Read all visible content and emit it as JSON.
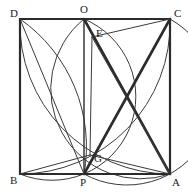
{
  "figure": {
    "background": "#ffffff",
    "stroke_color": "#3a3a3a",
    "thick_stroke_color": "#2b2b2b",
    "thin_width": 1,
    "medium_width": 1.4,
    "thick_width": 2.6,
    "viewbox": "0 0 188 192"
  },
  "points": [
    {
      "id": "D",
      "label": "D",
      "x": 20,
      "y": 19,
      "label_x": 10,
      "label_y": 17
    },
    {
      "id": "O",
      "label": "O",
      "x": 84,
      "y": 19,
      "label_x": 80,
      "label_y": 13
    },
    {
      "id": "C",
      "label": "C",
      "x": 170,
      "y": 19,
      "label_x": 174,
      "label_y": 17
    },
    {
      "id": "E",
      "label": "E",
      "x": 92,
      "y": 37,
      "label_x": 96,
      "label_y": 37
    },
    {
      "id": "G",
      "label": "G",
      "x": 90,
      "y": 155,
      "label_x": 94,
      "label_y": 162
    },
    {
      "id": "B",
      "label": "B",
      "x": 20,
      "y": 174,
      "label_x": 10,
      "label_y": 184
    },
    {
      "id": "P",
      "label": "P",
      "x": 84,
      "y": 174,
      "label_x": 80,
      "label_y": 186
    },
    {
      "id": "A",
      "label": "A",
      "x": 170,
      "y": 174,
      "label_x": 172,
      "label_y": 186
    }
  ],
  "square": {
    "name": "square-ABCD",
    "corners": "20,19 170,19 170,174 20,174"
  },
  "segments": [
    {
      "name": "segment-OP",
      "from": "O",
      "to": "P",
      "d": "M 84 19 L 84 174",
      "weight": "medium"
    },
    {
      "name": "segment-OA",
      "from": "O",
      "to": "A",
      "d": "M 84 19 L 170 174",
      "weight": "thick"
    },
    {
      "name": "segment-PC",
      "from": "P",
      "to": "C",
      "d": "M 84 174 L 170 19",
      "weight": "thick"
    },
    {
      "name": "segment-DP",
      "from": "D",
      "to": "P",
      "d": "M 20 19 L 84 174",
      "weight": "thin"
    },
    {
      "name": "segment-EA",
      "from": "E",
      "to": "A",
      "d": "M 92 37 L 170 174",
      "weight": "thin"
    },
    {
      "name": "segment-EC",
      "from": "E",
      "to": "C",
      "d": "M 92 37 L 170 19",
      "weight": "thin"
    },
    {
      "name": "segment-EG",
      "from": "E",
      "to": "G",
      "d": "M 92 37 L 90 155",
      "weight": "thin"
    },
    {
      "name": "segment-BG",
      "from": "B",
      "to": "G",
      "d": "M 20 174 L 90 155",
      "weight": "thin"
    },
    {
      "name": "segment-GA",
      "from": "G",
      "to": "A",
      "d": "M 90 155 L 170 174",
      "weight": "thin"
    }
  ],
  "arcs": [
    {
      "name": "arc-D-to-P-center-B",
      "d": "M 20 19 A 155 155 0 0 1 84 174",
      "weight": "thin"
    },
    {
      "name": "arc-O-to-B-center-D",
      "d": "M 84 19 A 64 64 0 0 1 20 174",
      "weight": "thin"
    },
    {
      "name": "arc-D-to-A-center-C",
      "d": "M 20 19 A 150 150 0 0 0 170 174",
      "weight": "thin"
    },
    {
      "name": "arc-O-to-A-center-C",
      "d": "M 84 19 A 90 90 0 0 0 170 174",
      "weight": "thin"
    },
    {
      "name": "arc-B-to-C-center-A",
      "d": "M 20 174 A 150 150 0 0 0 170 19",
      "weight": "thin"
    },
    {
      "name": "arc-P-to-C-center-A",
      "d": "M 84 174 A 88 88 0 0 0 170 19",
      "weight": "thin"
    }
  ]
}
